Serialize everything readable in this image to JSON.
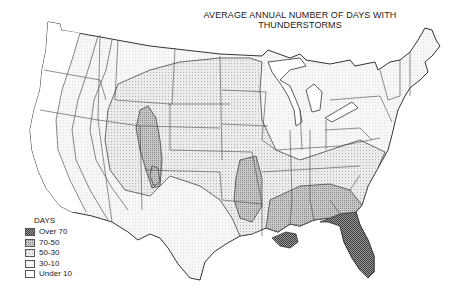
{
  "title": {
    "line1": "AVERAGE ANNUAL NUMBER OF DAYS WITH",
    "line2": "THUNDERSTORMS"
  },
  "legend": {
    "title": "DAYS",
    "items": [
      {
        "label": "Over 70",
        "pattern": "dense-dots",
        "color": "#6e6e6e"
      },
      {
        "label": "70-50",
        "pattern": "medium-dots",
        "color": "#a8a8a8"
      },
      {
        "label": "50-30",
        "pattern": "light-dots",
        "color": "#d6d6d6"
      },
      {
        "label": "30-10",
        "pattern": "very-light",
        "color": "#f2f2f2"
      },
      {
        "label": "Under 10",
        "pattern": "blank",
        "color": "#ffffff"
      }
    ]
  },
  "colors": {
    "outline": "#333333",
    "over70": "#6e6e6e",
    "c70_50": "#a8a8a8",
    "c50_30": "#d6d6d6",
    "c30_10": "#f2f2f2",
    "under10": "#ffffff"
  }
}
